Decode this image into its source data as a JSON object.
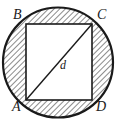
{
  "figure": {
    "type": "geometric-diagram",
    "canvas": {
      "width": 118,
      "height": 124,
      "background": "#ffffff"
    },
    "colors": {
      "stroke": "#1a1a1a",
      "hatch": "#2b2b2b",
      "fill_interior": "#ffffff",
      "label": "#1a1a1a"
    },
    "circle": {
      "name": "circumscribed-circle",
      "cx": 58,
      "cy": 62.5,
      "r": 55,
      "stroke_width": 2.2,
      "fill": "none"
    },
    "square": {
      "name": "inscribed-square",
      "x": 26,
      "y": 24,
      "width": 66,
      "height": 76,
      "stroke_width": 1.6,
      "fill": "#ffffff"
    },
    "diagonal": {
      "name": "diagonal-AC",
      "from": "A",
      "to": "C",
      "x1": 26,
      "y1": 100,
      "x2": 92,
      "y2": 24,
      "stroke_width": 1.4,
      "label": "d"
    },
    "hatching": {
      "description": "45-degree diagonal hatch lines filling the four regions between the circle and the inscribed square",
      "angle_degrees": 45,
      "spacing": 4,
      "line_width": 1.1
    },
    "vertices": [
      {
        "id": "A",
        "label": "A",
        "position": "bottom-left",
        "x": 26,
        "y": 100
      },
      {
        "id": "B",
        "label": "B",
        "position": "top-left",
        "x": 26,
        "y": 24
      },
      {
        "id": "C",
        "label": "C",
        "position": "top-right",
        "x": 92,
        "y": 24
      },
      {
        "id": "D",
        "label": "D",
        "position": "bottom-right",
        "x": 92,
        "y": 100
      }
    ],
    "labels": {
      "A": "A",
      "B": "B",
      "C": "C",
      "D": "D",
      "diagonal": "d"
    }
  }
}
